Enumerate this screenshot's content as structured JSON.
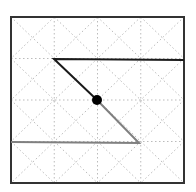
{
  "diagram": {
    "type": "grid-path",
    "grid": {
      "rows": 4,
      "cols": 4,
      "cell_diagonals": true,
      "style": "dotted"
    },
    "frame": {
      "x0": 11,
      "y0": 17,
      "x1": 184,
      "y1": 183
    },
    "colors": {
      "frame": "#333333",
      "grid": "#bbbbbb",
      "path_black": "#1a1a1a",
      "path_gray": "#808080",
      "dot": "#000000"
    },
    "paths": [
      {
        "name": "black-path",
        "color": "#1a1a1a",
        "points": [
          [
            184,
            60
          ],
          [
            54,
            59
          ],
          [
            97,
            100
          ]
        ]
      },
      {
        "name": "gray-path",
        "color": "#808080",
        "points": [
          [
            97,
            100
          ],
          [
            139,
            143
          ],
          [
            11,
            142
          ]
        ]
      }
    ],
    "center_dot": {
      "cx": 97,
      "cy": 100,
      "r": 5
    }
  }
}
